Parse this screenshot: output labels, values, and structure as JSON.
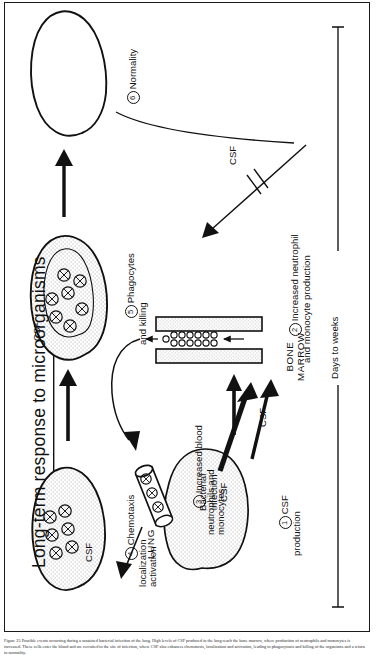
{
  "figure": {
    "title": "Long-term response to microorganisms",
    "timeline_label": "Days to weeks",
    "caption": "Figure 25   Possible events occurring during a sustained bacterial infection of the lung. High levels of CSF produced in the lung reach the bone marrow, where production of neutrophils and monocytes is increased. These cells enter the blood and are recruited to the site of infection, where CSF also enhances chemotaxis, localization and activation, leading to phagocytosis and killing of the organisms and a return to normality."
  },
  "organs": {
    "lung": "LUNG",
    "bone_marrow": "BONE\nMARROW"
  },
  "labels": {
    "lung_inner": "Bacterial\ninfection\nCSF",
    "csf_arrow_marrow": "CSF",
    "csf_blood_long": "CSF",
    "csf_chemotaxis": "CSF",
    "csf_phagocyte": "CSF"
  },
  "steps": [
    {
      "num": "1",
      "glyph": "①",
      "text": "CSF\nproduction"
    },
    {
      "num": "2",
      "glyph": "②",
      "text": "Increased neutrophil\nand monocyte production"
    },
    {
      "num": "3",
      "glyph": "③",
      "text": "Increased blood\nneutrophils and\nmonocytes"
    },
    {
      "num": "4",
      "glyph": "④",
      "text": "Chemotaxis\nlocalization\nactivation"
    },
    {
      "num": "5",
      "glyph": "⑤",
      "text": "Phagocytes\nand killing"
    },
    {
      "num": "6",
      "glyph": "⑥",
      "text": "Normality"
    }
  ],
  "colors": {
    "ink": "#111111",
    "stipple": "#8d8d8d",
    "paper": "#ffffff"
  }
}
